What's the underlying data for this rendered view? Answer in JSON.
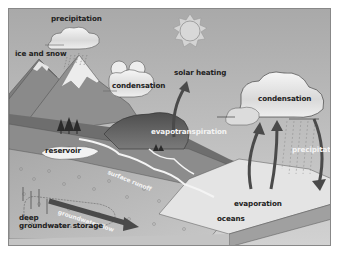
{
  "diagram": {
    "labels": {
      "precipitation_top": "precipitation",
      "ice_and_snow": "ice and snow",
      "condensation_left": "condensation",
      "solar_heating": "solar heating",
      "condensation_right": "condensation",
      "evapotranspiration": "evapotranspiration",
      "reservoir": "reservoir",
      "surface_runoff": "surface runoff",
      "precipitation_right": "precipitation",
      "evaporation": "evaporation",
      "oceans": "oceans",
      "groundwater_flow": "groundwater flow",
      "deep_groundwater_storage_line1": "deep",
      "deep_groundwater_storage_line2": "groundwater storage"
    },
    "colors": {
      "sky_top": "#9a9a9a",
      "sky_bottom": "#cfcfcf",
      "mountain": "#8a8a8a",
      "mountain_dark": "#5e5e5e",
      "snow": "#e8e8e8",
      "ground": "#7a7a7a",
      "soil": "#b8b8b8",
      "ocean": "#e6e6e6",
      "arrow": "#4a4a4a",
      "cloud": "#f0f0f0"
    }
  }
}
